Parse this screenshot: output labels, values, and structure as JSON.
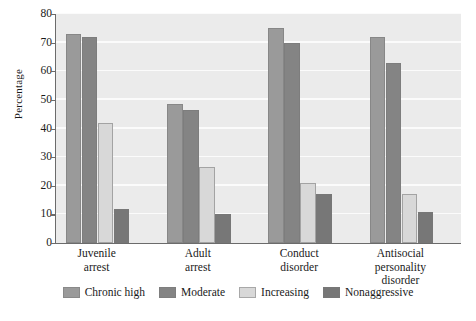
{
  "chart_data": {
    "type": "bar",
    "title": "",
    "subtitle": "",
    "xlabel": "",
    "ylabel": "Percentage",
    "ylim": [
      0,
      80
    ],
    "yticks": [
      0,
      10,
      20,
      30,
      40,
      50,
      60,
      70,
      80
    ],
    "ytick_labels": [
      "0",
      "10",
      "20",
      "30",
      "40",
      "50",
      "60",
      "70",
      "80"
    ],
    "grid": "horizontal",
    "legend_position": "bottom",
    "categories": [
      "Juvenile arrest",
      "Adult arrest",
      "Conduct disorder",
      "Antisocial personality disorder"
    ],
    "category_label_lines": [
      [
        "Juvenile",
        "arrest"
      ],
      [
        "Adult",
        "arrest"
      ],
      [
        "Conduct",
        "disorder"
      ],
      [
        "Antisocial",
        "personality",
        "disorder"
      ]
    ],
    "series": [
      {
        "name": "Chronic high",
        "color": "#9a9a9a",
        "values": [
          73,
          48.5,
          75,
          72
        ]
      },
      {
        "name": "Moderate",
        "color": "#848484",
        "values": [
          72,
          46.5,
          70,
          63
        ]
      },
      {
        "name": "Increasing",
        "color": "#d8d8d8",
        "values": [
          42,
          26.5,
          21,
          17
        ]
      },
      {
        "name": "Nonaggressive",
        "color": "#777777",
        "values": [
          12,
          10,
          17,
          11
        ]
      }
    ],
    "plot_background": "#ebebeb",
    "gridline_color": "#fbfbfb",
    "axis_color": "#6b6b6b"
  },
  "legend": {
    "items": [
      {
        "label": "Chronic high"
      },
      {
        "label": "Moderate"
      },
      {
        "label": "Increasing"
      },
      {
        "label": "Nonaggressive"
      }
    ]
  }
}
